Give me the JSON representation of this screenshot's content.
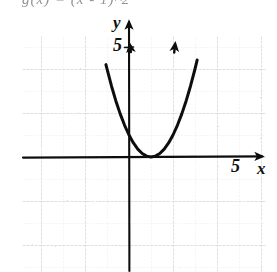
{
  "figure": {
    "title_fragment": "g(x) = (x - 1)^2",
    "background_color": "#ffffff",
    "ink_color": "#111111",
    "grid_color": "#c9c9c9",
    "grid_minor_color": "#dcdcdc"
  },
  "axes": {
    "x_axis_label": "x",
    "y_axis_label": "y",
    "x_tick_label": "5",
    "y_tick_label": "5",
    "x_tick_value": 5,
    "y_tick_value": 5,
    "origin_px": {
      "x": 129,
      "y": 157
    },
    "unit_px": 22,
    "x_axis_arrow": "right",
    "y_axis_arrow": "up"
  },
  "grid": {
    "left_px": 22,
    "top_px": 36,
    "right_px": 266,
    "bottom_px": 272,
    "major_spacing_px": 44,
    "minor_spacing_px": 22,
    "visible": true
  },
  "chart_data": {
    "type": "line",
    "title": "g(x) = (x - 1)^2",
    "subtitle": "",
    "xlabel": "x",
    "ylabel": "y",
    "xlim": [
      -5,
      6.5
    ],
    "ylim": [
      -5,
      5.5
    ],
    "grid": true,
    "legend": null,
    "annotations": [
      {
        "text": "5",
        "x": 5,
        "y": 0,
        "role": "x-axis tick label"
      },
      {
        "text": "5",
        "x": 0,
        "y": 5,
        "role": "y-axis tick label"
      },
      {
        "text": "x",
        "x": 6.2,
        "y": -0.3,
        "role": "x-axis name"
      },
      {
        "text": "y",
        "x": -0.5,
        "y": 5.9,
        "role": "y-axis name"
      }
    ],
    "series": [
      {
        "name": "g(x) = (x - 1)^2",
        "equation": "y = (x - 1)^2",
        "vertex": [
          1,
          0
        ],
        "opens": "up",
        "arrowheads": [
          "left-branch-up",
          "right-branch-up"
        ],
        "x": [
          -1.05,
          -0.8,
          -0.6,
          -0.4,
          -0.2,
          0,
          0.2,
          0.4,
          0.6,
          0.8,
          1,
          1.2,
          1.4,
          1.6,
          1.8,
          2,
          2.2,
          2.4,
          2.6,
          2.8,
          3,
          3.1
        ],
        "values": [
          4.2,
          3.24,
          2.56,
          1.96,
          1.44,
          1,
          0.64,
          0.36,
          0.16,
          0.04,
          0,
          0.04,
          0.16,
          0.36,
          0.64,
          1,
          1.44,
          1.96,
          2.56,
          3.24,
          4,
          4.41
        ]
      }
    ]
  }
}
